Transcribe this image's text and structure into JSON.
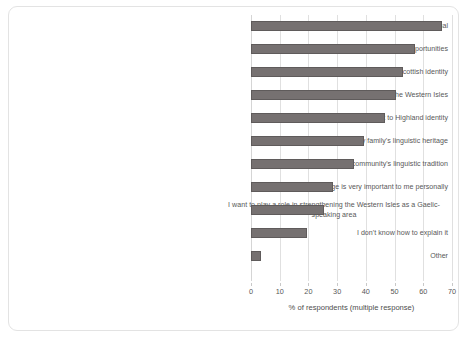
{
  "chart_data": {
    "type": "bar",
    "orientation": "horizontal",
    "title": "",
    "xlabel": "% of respondents (multiple response)",
    "ylabel": "",
    "xlim": [
      0,
      70
    ],
    "xticks": [
      0,
      10,
      20,
      30,
      40,
      50,
      60,
      70
    ],
    "grid": true,
    "legend": false,
    "bar_color": "#767171",
    "bar_border_color": "#5f5b5b",
    "categories": [
      "There are advantages to being bilingual",
      "Having Gaelic improves my employment opportunities",
      "The Gaelic language is very important to Scottish identity",
      "Gaelic is important to the economy of the Western Isles",
      "The Gaelic language is very important to Highland identity",
      "I am committed to my family's linguistic heritage",
      "I am committed to my community's linguistic tradition",
      "The Gaelic language is very important to me personally",
      "I want to play a role in strengthening the Western Isles as a Gaelic-speaking area",
      "I don't know how to explain it",
      "Other"
    ],
    "values": [
      66.5,
      57,
      53,
      50.5,
      46.5,
      39.5,
      36,
      28.5,
      25.5,
      19.5,
      3.5
    ]
  }
}
